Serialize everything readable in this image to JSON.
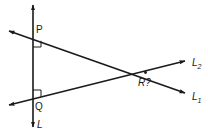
{
  "diagram": {
    "type": "geometry",
    "background": "#ffffff",
    "stroke_color": "#1a1a1a",
    "lines": [
      {
        "name": "L",
        "label": "L",
        "from": [
          33,
          128
        ],
        "to": [
          33,
          4
        ],
        "arrows": "both"
      },
      {
        "name": "L1",
        "label": "L",
        "subscript": "1",
        "from": [
          8,
          31
        ],
        "to": [
          186,
          94
        ],
        "arrows": "both"
      },
      {
        "name": "L2",
        "label": "L",
        "subscript": "2",
        "from": [
          8,
          105
        ],
        "to": [
          186,
          60
        ],
        "arrows": "both"
      }
    ],
    "points": [
      {
        "name": "P",
        "label": "P",
        "at": [
          33,
          38
        ]
      },
      {
        "name": "Q",
        "label": "Q",
        "at": [
          33,
          99
        ]
      },
      {
        "name": "R",
        "label": "R?",
        "at": [
          146,
          72
        ]
      }
    ],
    "right_angles": [
      {
        "at": "P",
        "position": "below-right"
      },
      {
        "at": "Q",
        "position": "above-right"
      }
    ]
  },
  "labels": {
    "p": "P",
    "q": "Q",
    "r": "R?",
    "l": "L",
    "l1_main": "L",
    "l1_sub": "1",
    "l2_main": "L",
    "l2_sub": "2"
  }
}
